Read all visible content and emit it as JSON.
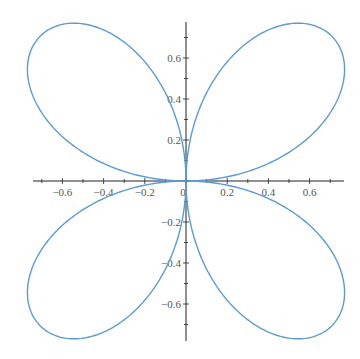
{
  "chart_data": {
    "type": "line",
    "subtype": "polar-parametric",
    "title": "",
    "equation": "r = sin(2*theta)",
    "theta_range": [
      0,
      6.283185
    ],
    "xlabel": "",
    "ylabel": "",
    "xlim": [
      -0.74,
      0.76
    ],
    "ylim": [
      -0.78,
      0.77
    ],
    "grid": false,
    "legend": null,
    "axes_through_origin": true,
    "x_ticks": [
      -0.6,
      -0.4,
      -0.2,
      0,
      0.2,
      0.4,
      0.6
    ],
    "x_tick_labels": [
      "-0.6",
      "-0.4",
      "-0.2",
      "0",
      "0.2",
      "0.4",
      "0.6"
    ],
    "y_ticks": [
      -0.6,
      -0.4,
      -0.2,
      0.2,
      0.4,
      0.6
    ],
    "y_tick_labels": [
      "-0.6",
      "-0.4",
      "-0.2",
      "0.2",
      "0.4",
      "0.6"
    ],
    "series": [
      {
        "name": "rose",
        "color": "#5b9bd5",
        "line_width": 1.4
      }
    ]
  },
  "style": {
    "curve_color": "#5b9bd5",
    "axis_color": "#222222",
    "label_color": "#555555"
  }
}
